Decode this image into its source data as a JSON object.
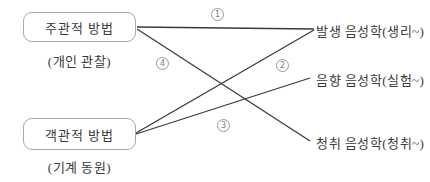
{
  "diagram": {
    "left_nodes": [
      {
        "id": "subjective",
        "label": "주관적 방법",
        "caption": "(개인 관찰)"
      },
      {
        "id": "objective",
        "label": "객관적 방법",
        "caption": "(기계 동원)"
      }
    ],
    "right_nodes": [
      {
        "id": "generative",
        "label": "발생 음성학(생리~)"
      },
      {
        "id": "acoustic",
        "label": "음향 음성학(실험~)"
      },
      {
        "id": "auditory",
        "label": "청취 음성학(청취~)"
      }
    ],
    "edges": [
      {
        "number": "1",
        "from": "주관적 방법",
        "to": "발생 음성학(생리~)"
      },
      {
        "number": "2",
        "from": "객관적 방법",
        "to": "발생 음성학(생리~)"
      },
      {
        "number": "3",
        "from": "객관적 방법",
        "to": "음향 음성학(실험~)"
      },
      {
        "number": "4",
        "from": "주관적 방법",
        "to": "청취 음성학(청취~)"
      }
    ],
    "colors": {
      "background": "#ffffff",
      "line": "#3a3a3a",
      "box_border": "#a8a8a8",
      "text": "#3a3a3a",
      "badge": "#7d7d7d"
    }
  }
}
